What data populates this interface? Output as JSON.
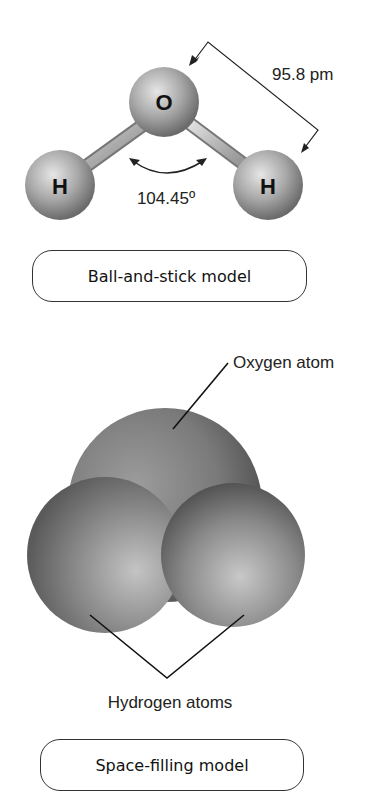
{
  "ball_and_stick": {
    "atoms": {
      "oxygen": "O",
      "hydrogen_left": "H",
      "hydrogen_right": "H"
    },
    "bond_length": "95.8 pm",
    "bond_angle": "104.45º",
    "caption": "Ball-and-stick model"
  },
  "space_filling": {
    "oxygen_label": "Oxygen atom",
    "hydrogen_label": "Hydrogen atoms",
    "caption": "Space-filling model"
  }
}
